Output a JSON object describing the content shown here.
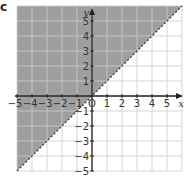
{
  "figure_label": "c",
  "colors": {
    "shade": "#9e9e9e",
    "shade_grid": "#c4c4c4",
    "grid": "#d6d6d6",
    "axis": "#222222",
    "boundary": "#333333"
  },
  "chart_data": {
    "type": "area",
    "title": "",
    "xlabel": "x",
    "ylabel": "y",
    "xlim": [
      -5,
      6
    ],
    "ylim": [
      -5,
      6
    ],
    "grid": true,
    "x_ticks": [
      -5,
      -4,
      -3,
      -2,
      -1,
      0,
      1,
      2,
      3,
      4,
      5
    ],
    "y_ticks": [
      -5,
      -4,
      -3,
      -2,
      -1,
      1,
      2,
      3,
      4,
      5
    ],
    "boundary_line": {
      "equation": "y = x",
      "style": "dashed",
      "points": [
        [
          -5,
          -5
        ],
        [
          6,
          6
        ]
      ]
    },
    "shaded_region": {
      "inequality": "y > x",
      "side": "above-left"
    },
    "legend": null
  }
}
